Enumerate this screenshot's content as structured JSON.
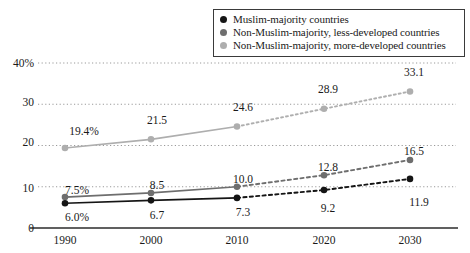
{
  "legend": {
    "position": "top-right",
    "entries": [
      {
        "label": "Muslim-majority countries",
        "color": "#151515",
        "swatch": "series-marker-dot"
      },
      {
        "label": "Non-Muslim-majority, less-developed countries",
        "color": "#6e6e6e",
        "swatch": "series-marker-dot"
      },
      {
        "label": "Non-Muslim-majority, more-developed countries",
        "color": "#aeaeae",
        "swatch": "series-marker-dot"
      }
    ]
  },
  "chart_data": {
    "type": "line",
    "title": "",
    "subtitle": "",
    "xlabel": "",
    "ylabel": "",
    "categories": [
      "1990",
      "2000",
      "2010",
      "2020",
      "2030"
    ],
    "x": [
      1990,
      2000,
      2010,
      2020,
      2030
    ],
    "ylim": [
      0,
      40
    ],
    "yticks": [
      0,
      10,
      20,
      30,
      40
    ],
    "ytick_labels": [
      "0",
      "10",
      "20",
      "30",
      "40%"
    ],
    "xtick_labels": [
      "1990",
      "2000",
      "2010",
      "2020",
      "2030"
    ],
    "grid": "horizontal-dotted",
    "projection_starts_after": "2010",
    "series": [
      {
        "name": "Muslim-majority countries",
        "color": "#151515",
        "values": [
          6.0,
          6.7,
          7.3,
          9.2,
          11.9
        ],
        "point_labels": [
          "6.0%",
          "6.7",
          "7.3",
          "9.2",
          "11.9"
        ],
        "label_positions": [
          "below",
          "below",
          "below",
          "below",
          "below"
        ]
      },
      {
        "name": "Non-Muslim-majority, less-developed countries",
        "color": "#6e6e6e",
        "values": [
          7.5,
          8.5,
          10.0,
          12.8,
          16.5
        ],
        "point_labels": [
          "7.5%",
          "8.5",
          "10.0",
          "12.8",
          "16.5"
        ],
        "label_positions": [
          "above",
          "above",
          "above",
          "above",
          "above"
        ]
      },
      {
        "name": "Non-Muslim-majority, more-developed countries",
        "color": "#aeaeae",
        "values": [
          19.4,
          21.5,
          24.6,
          28.9,
          33.1
        ],
        "point_labels": [
          "19.4%",
          "21.5",
          "24.6",
          "28.9",
          "33.1"
        ],
        "label_positions": [
          "above",
          "above",
          "above",
          "above",
          "above"
        ]
      }
    ]
  },
  "colors": {
    "axis": "#2b2b2b",
    "grid": "#9a9a9a",
    "background": "#ffffff",
    "text": "#1a1a1a"
  }
}
